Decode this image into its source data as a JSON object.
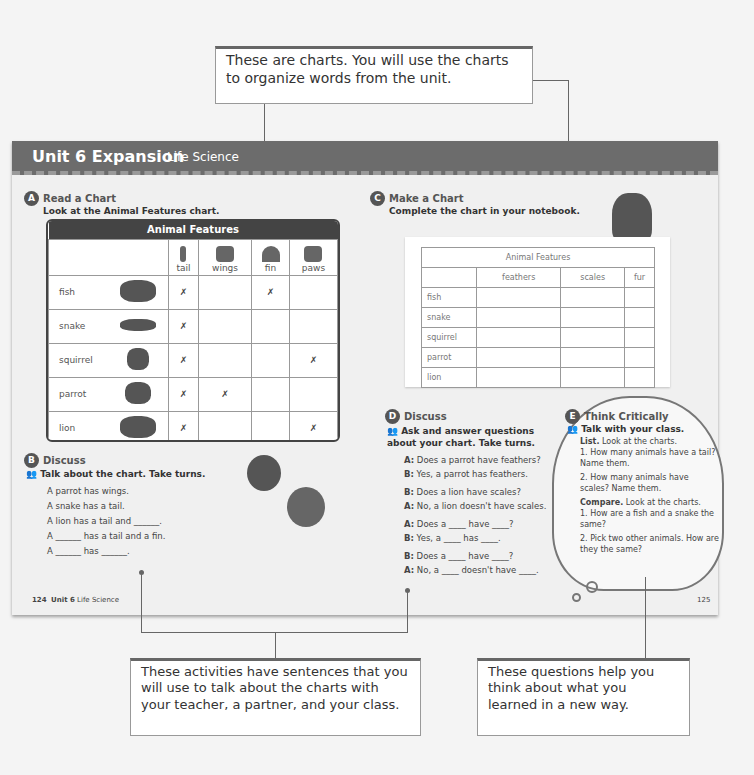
{
  "callouts": {
    "top": "These are charts. You will use the charts to organize words from the unit.",
    "bottom_left": "These activities have sentences that you will use to talk about the charts with your teacher, a partner, and your class.",
    "bottom_right": "These questions help you think about what you learned in a new way."
  },
  "header": {
    "unit": "Unit 6  Expansion",
    "subject": "Life Science"
  },
  "section_a": {
    "badge": "A",
    "title": "Read a Chart",
    "instruction": "Look at the Animal Features chart.",
    "table": {
      "caption": "Animal Features",
      "columns": [
        {
          "label": "tail",
          "icon": "tail-icon"
        },
        {
          "label": "wings",
          "icon": "wing-icon"
        },
        {
          "label": "fin",
          "icon": "fin-icon"
        },
        {
          "label": "paws",
          "icon": "paw-icon"
        }
      ],
      "rows": [
        {
          "animal": "fish",
          "marks": [
            "✗",
            "",
            "✗",
            ""
          ]
        },
        {
          "animal": "snake",
          "marks": [
            "✗",
            "",
            "",
            ""
          ]
        },
        {
          "animal": "squirrel",
          "marks": [
            "✗",
            "",
            "",
            "✗"
          ]
        },
        {
          "animal": "parrot",
          "marks": [
            "✗",
            "✗",
            "",
            ""
          ]
        },
        {
          "animal": "lion",
          "marks": [
            "✗",
            "",
            "",
            "✗"
          ]
        }
      ]
    }
  },
  "section_b": {
    "badge": "B",
    "title": "Discuss",
    "instruction": "Talk about the chart. Take turns.",
    "lines": [
      "A parrot has wings.",
      "A snake has a tail.",
      "A lion has a tail and ______.",
      "A ______ has a tail and a fin.",
      "A ______ has ______."
    ]
  },
  "section_c": {
    "badge": "C",
    "title": "Make a Chart",
    "instruction": "Complete the chart in your notebook.",
    "table": {
      "caption": "Animal Features",
      "columns": [
        "feathers",
        "scales",
        "fur"
      ],
      "rows": [
        "fish",
        "snake",
        "squirrel",
        "parrot",
        "lion"
      ]
    }
  },
  "section_d": {
    "badge": "D",
    "title": "Discuss",
    "instruction": "Ask and answer questions about your chart. Take turns.",
    "dialog": [
      {
        "speaker": "A:",
        "text": "Does a parrot have feathers?"
      },
      {
        "speaker": "B:",
        "text": "Yes, a parrot has feathers."
      },
      {
        "speaker": "B:",
        "text": "Does a lion have scales?"
      },
      {
        "speaker": "A:",
        "text": "No, a lion doesn't have scales."
      },
      {
        "speaker": "A:",
        "text": "Does a ____ have ____?"
      },
      {
        "speaker": "B:",
        "text": "Yes, a ____ has ____."
      },
      {
        "speaker": "B:",
        "text": "Does a ____ have ____?"
      },
      {
        "speaker": "A:",
        "text": "No, a ____ doesn't have ____."
      }
    ]
  },
  "section_e": {
    "badge": "E",
    "title": "Think Critically",
    "instruction": "Talk with your class.",
    "list_label": "List.",
    "list_text": "Look at the charts.",
    "list_items": [
      "1. How many animals have a tail? Name them.",
      "2. How many animals have scales? Name them."
    ],
    "compare_label": "Compare.",
    "compare_text": "Look at the charts.",
    "compare_items": [
      "1. How are a fish and a snake the same?",
      "2. Pick two other animals. How are they the same?"
    ]
  },
  "footer": {
    "left_num": "124",
    "left_unit": "Unit 6",
    "left_subject": "Life Science",
    "right_num": "125"
  }
}
